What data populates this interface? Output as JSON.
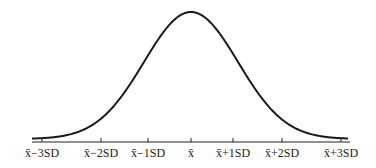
{
  "chart_data": {
    "type": "line",
    "xlabel": "",
    "ylabel": "",
    "x_ticks": [
      "x̄−3SD",
      "x̄−2SD",
      "x̄−1SD",
      "x̄",
      "x̄+1SD",
      "x̄+2SD",
      "x̄+3SD"
    ],
    "x_values": [
      -3,
      -2,
      -1,
      0,
      1,
      2,
      3
    ],
    "grid": false,
    "legend": null
  },
  "labels": {
    "m3": "x̄−3SD",
    "m2": "x̄−2SD",
    "m1": "x̄−1SD",
    "mean": "x̄",
    "p1": "x̄+1SD",
    "p2": "x̄+2SD",
    "p3": "x̄+3SD"
  }
}
